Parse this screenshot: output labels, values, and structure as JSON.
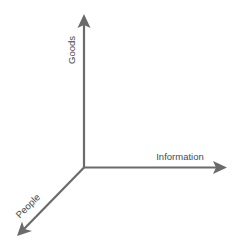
{
  "diagram": {
    "type": "3d-axes",
    "line_color": "#6b6b6b",
    "text_color": "#4a4a4a",
    "origin": [
      84,
      167
    ],
    "axes": [
      {
        "id": "goods",
        "label": "Goods",
        "direction": "up",
        "tip": [
          84,
          14
        ]
      },
      {
        "id": "information",
        "label": "Information",
        "direction": "right",
        "tip": [
          227,
          168
        ]
      },
      {
        "id": "people",
        "label": "People",
        "direction": "down-left",
        "tip": [
          17,
          236
        ]
      }
    ]
  }
}
